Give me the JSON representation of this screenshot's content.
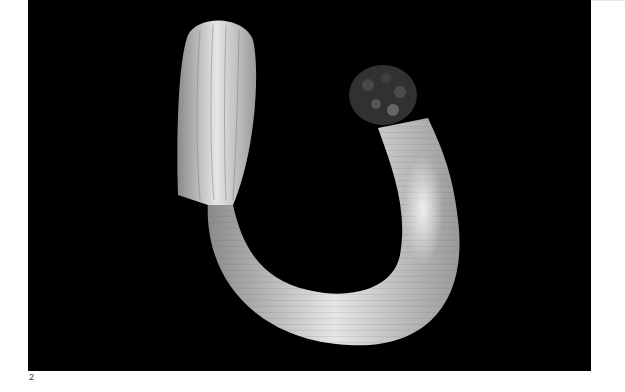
{
  "figure": {
    "background_color": "#000000",
    "specimen_color": "#d8d8d8"
  },
  "caption": {
    "number": "2"
  }
}
